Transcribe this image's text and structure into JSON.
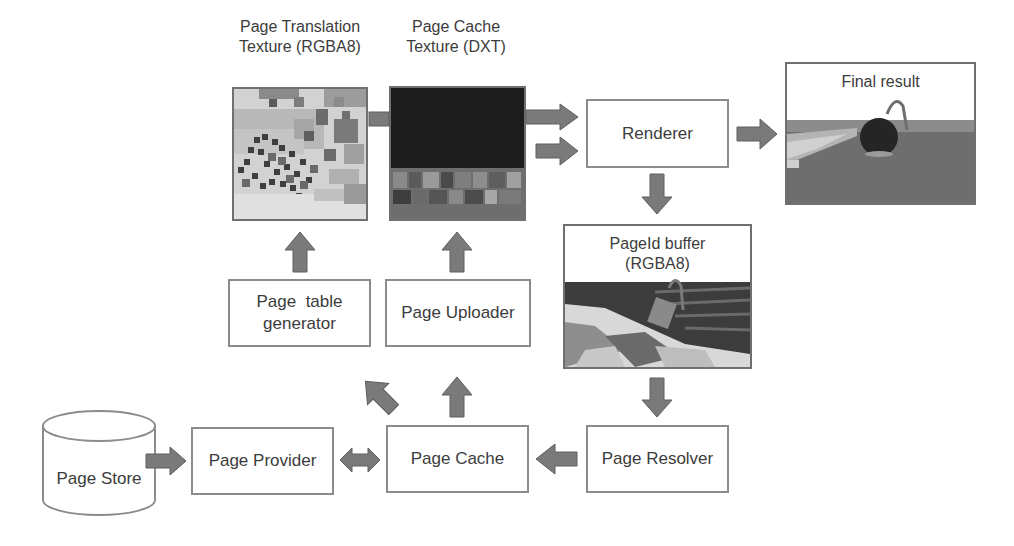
{
  "diagram": {
    "nodes": {
      "page_translation_texture": {
        "caption_line1": "Page Translation",
        "caption_line2": "Texture (RGBA8)"
      },
      "page_cache_texture": {
        "caption_line1": "Page Cache",
        "caption_line2": "Texture (DXT)"
      },
      "renderer": {
        "label": "Renderer"
      },
      "final_result": {
        "label": "Final result"
      },
      "pageid_buffer": {
        "label_line1": "PageId buffer",
        "label_line2": "(RGBA8)"
      },
      "page_table_generator": {
        "label_line1": "Page  table",
        "label_line2": "generator"
      },
      "page_uploader": {
        "label": "Page Uploader"
      },
      "page_store": {
        "label": "Page Store"
      },
      "page_provider": {
        "label": "Page Provider"
      },
      "page_cache": {
        "label": "Page Cache"
      },
      "page_resolver": {
        "label": "Page Resolver"
      }
    },
    "edges": [
      {
        "from": "page_store",
        "to": "page_provider",
        "direction": "right"
      },
      {
        "from": "page_provider",
        "to": "page_cache",
        "direction": "bidirectional"
      },
      {
        "from": "page_resolver",
        "to": "page_cache",
        "direction": "left"
      },
      {
        "from": "page_cache",
        "to": "page_table_generator",
        "direction": "up-left"
      },
      {
        "from": "page_cache",
        "to": "page_uploader",
        "direction": "up"
      },
      {
        "from": "page_table_generator",
        "to": "page_translation_texture",
        "direction": "up"
      },
      {
        "from": "page_uploader",
        "to": "page_cache_texture",
        "direction": "up"
      },
      {
        "from": "page_translation_texture",
        "to": "renderer",
        "direction": "right"
      },
      {
        "from": "page_cache_texture",
        "to": "renderer",
        "direction": "right"
      },
      {
        "from": "renderer",
        "to": "final_result",
        "direction": "right"
      },
      {
        "from": "renderer",
        "to": "pageid_buffer",
        "direction": "down"
      },
      {
        "from": "pageid_buffer",
        "to": "page_resolver",
        "direction": "down"
      }
    ],
    "colors": {
      "arrow_fill": "#7a7a7a",
      "arrow_stroke": "#5e5e5e",
      "box_border": "#8c8c8c"
    }
  }
}
